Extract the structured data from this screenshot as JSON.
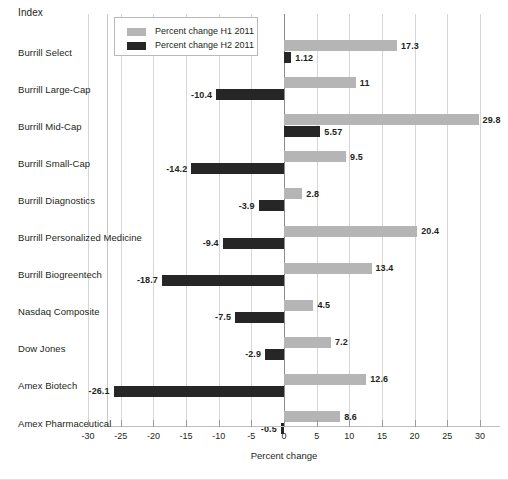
{
  "header": {
    "index_label": "Index"
  },
  "legend": {
    "position": "top-left-inside",
    "items": [
      {
        "label": "Percent change H1 2011",
        "color": "#b5b5b5",
        "name": "h1-2011"
      },
      {
        "label": "Percent change H2 2011",
        "color": "#262626",
        "name": "h2-2011"
      }
    ]
  },
  "axis": {
    "x_title": "Percent change",
    "x_ticks": [
      -30,
      -25,
      -20,
      -15,
      -10,
      -5,
      0,
      5,
      10,
      15,
      20,
      25,
      30
    ],
    "x_tick_labels": [
      "-30",
      "-25",
      "-20",
      "-15",
      "-10",
      "-5",
      "0",
      "5",
      "10",
      "15",
      "20",
      "25",
      "30"
    ],
    "xlim": [
      -30,
      30
    ],
    "grid": "vertical"
  },
  "chart_data": {
    "type": "bar",
    "orientation": "horizontal",
    "title": "",
    "subtitle": "",
    "xlabel": "Percent change",
    "ylabel": "Index",
    "xlim": [
      -30,
      30
    ],
    "grid": true,
    "legend_position": "top-left",
    "categories": [
      "Burrill Select",
      "Burrill Large-Cap",
      "Burrill Mid-Cap",
      "Burrill Small-Cap",
      "Burrill Diagnostics",
      "Burrill Personalized Medicine",
      "Burrill Biogreentech",
      "Nasdaq Composite",
      "Dow Jones",
      "Amex Biotech",
      "Amex Pharmaceutical"
    ],
    "series": [
      {
        "name": "Percent change H1 2011",
        "color": "#b5b5b5",
        "values": [
          17.3,
          11,
          29.8,
          9.5,
          2.8,
          20.4,
          13.4,
          4.5,
          7.2,
          12.6,
          8.6
        ],
        "labels": [
          "17.3",
          "11",
          "29.8",
          "9.5",
          "2.8",
          "20.4",
          "13.4",
          "4.5",
          "7.2",
          "12.6",
          "8.6"
        ]
      },
      {
        "name": "Percent change H2 2011",
        "color": "#262626",
        "values": [
          1.12,
          -10.4,
          5.57,
          -14.2,
          -3.9,
          -9.4,
          -18.7,
          -7.5,
          -2.9,
          -26.1,
          -0.5
        ],
        "labels": [
          "1.12",
          "-10.4",
          "5.57",
          "-14.2",
          "-3.9",
          "-9.4",
          "-18.7",
          "-7.5",
          "-2.9",
          "-26.1",
          "-0.5"
        ]
      }
    ]
  }
}
